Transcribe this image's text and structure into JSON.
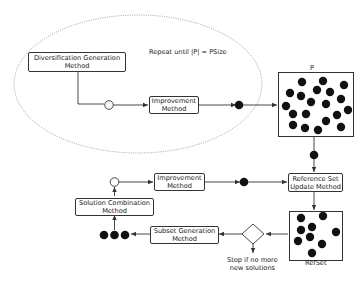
{
  "diagram": {
    "type": "scatter-search-flowchart",
    "loop_annotation": "Repeat until |P| = PSize",
    "nodes": {
      "diversification": {
        "line1": "Diversification Generation",
        "line2": "Method"
      },
      "improvement_top": {
        "line1": "Improvement",
        "line2": "Method"
      },
      "population": {
        "label": "P",
        "dot_count": 22
      },
      "refset_update": {
        "line1": "Reference Set",
        "line2": "Update Method"
      },
      "improvement_bottom": {
        "line1": "Improvement",
        "line2": "Method"
      },
      "solution_combination": {
        "line1": "Solution Combination",
        "line2": "Method"
      },
      "subset_generation": {
        "line1": "Subset Generation",
        "line2": "Method"
      },
      "refset": {
        "label": "RefSet",
        "dot_count": 10
      },
      "decision": {
        "line1": "Stop if no more",
        "line2": "new solutions"
      }
    },
    "colors": {
      "line": "#333333",
      "dot": "#111111",
      "ellipse": "#888888",
      "background": "#ffffff"
    }
  }
}
